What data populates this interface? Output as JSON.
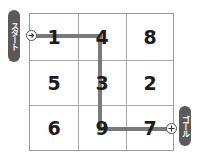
{
  "puzzle": {
    "start_label": "スタート",
    "goal_label": "ゴール",
    "grid": [
      [
        "1",
        "4",
        "8"
      ],
      [
        "5",
        "3",
        "2"
      ],
      [
        "6",
        "9",
        "7"
      ]
    ],
    "path_cells": [
      "1",
      "4",
      "3",
      "9",
      "7"
    ],
    "colors": {
      "path": "#7a7a7a",
      "label_bg": "#5a5a5a",
      "grid_line": "#a8a8a8",
      "digit": "#1c1c1c"
    }
  }
}
